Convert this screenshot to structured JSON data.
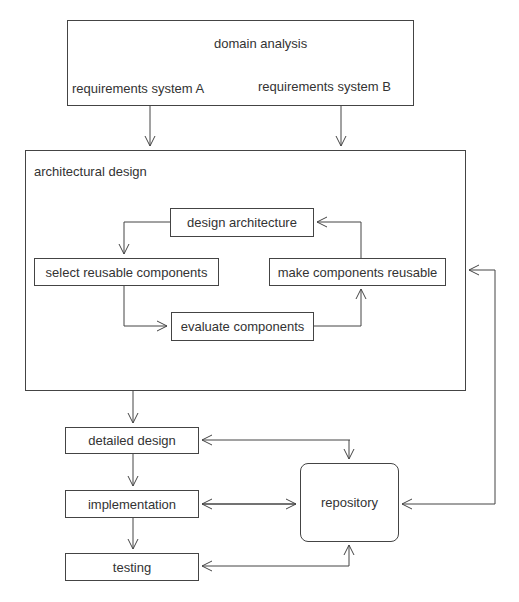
{
  "domain_box": {
    "title": "domain analysis",
    "left_label": "requirements system A",
    "right_label": "requirements system B"
  },
  "architectural_design": {
    "title": "architectural design",
    "nodes": {
      "design_architecture": "design architecture",
      "select_reusable": "select reusable components",
      "make_reusable": "make components reusable",
      "evaluate": "evaluate components"
    }
  },
  "lower_flow": {
    "detailed_design": "detailed design",
    "implementation": "implementation",
    "testing": "testing",
    "repository": "repository"
  },
  "colors": {
    "stroke": "#444444",
    "text": "#333333",
    "background": "#ffffff"
  }
}
